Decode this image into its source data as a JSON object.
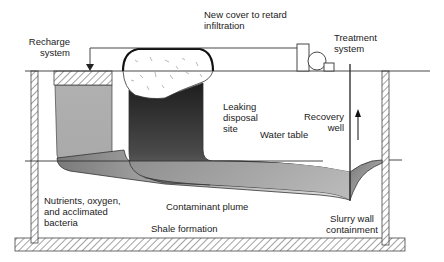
{
  "diagram": {
    "labels": {
      "recharge_system": "Recharge\nsystem",
      "new_cover": "New cover to retard\ninfiltration",
      "treatment_system": "Treatment\nsystem",
      "leaking_disposal_site": "Leaking\ndisposal\nsite",
      "recovery_well": "Recovery\nwell",
      "water_table": "Water table",
      "nutrients": "Nutrients, oxygen,\nand acclimated\nbacteria",
      "contaminant_plume": "Contaminant plume",
      "shale_formation": "Shale formation",
      "slurry_wall": "Slurry wall\ncontainment"
    },
    "colors": {
      "line": "#333333",
      "recharge_gray": "#b5b5b5",
      "plume_dark": "#2e2e2e",
      "plume_light": "#d8d8d8",
      "hatch": "#555555"
    }
  }
}
